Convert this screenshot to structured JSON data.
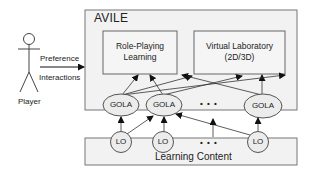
{
  "diagram": {
    "system": {
      "title": "AVILE"
    },
    "actor": {
      "label": "Player"
    },
    "actor_edges": {
      "top": "Preference",
      "bottom": "Interactions"
    },
    "components": [
      {
        "id": "rpl",
        "line1": "Role-Playing",
        "line2": "Learning"
      },
      {
        "id": "vlab",
        "line1": "Virtual Laboratory",
        "line2": "(2D/3D)"
      }
    ],
    "gola_nodes": [
      "GOLA",
      "GOLA",
      "GOLA"
    ],
    "gola_ellipsis": "• • •",
    "lo_nodes": [
      "LO",
      "LO",
      "LO"
    ],
    "lo_ellipsis": "• • •",
    "content": {
      "title": "Learning Content"
    },
    "colors": {
      "box_fill": "#f2f2f2",
      "inner_fill": "#f7f7f7",
      "stroke": "#555555",
      "text": "#222222"
    }
  }
}
